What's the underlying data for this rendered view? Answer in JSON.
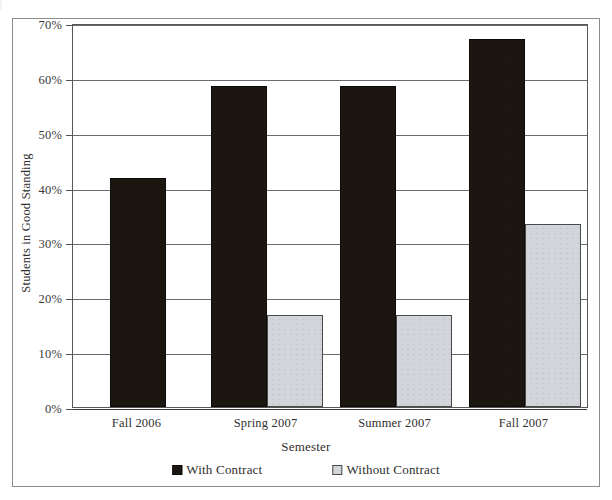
{
  "chart_data": {
    "type": "bar",
    "title": "",
    "xlabel": "Semester",
    "ylabel": "Students in Good Standing",
    "categories": [
      "Fall 2006",
      "Spring 2007",
      "Summer 2007",
      "Fall 2007"
    ],
    "series": [
      {
        "name": "With Contract",
        "values": [
          41.7,
          58.5,
          58.5,
          67.0
        ],
        "color": "#1b1610"
      },
      {
        "name": "Without Contract",
        "values": [
          null,
          16.8,
          16.8,
          33.4
        ],
        "color": "#d2d6da"
      }
    ],
    "ylim": [
      0,
      70
    ],
    "yticks": [
      "0%",
      "10%",
      "20%",
      "30%",
      "40%",
      "50%",
      "60%",
      "70%"
    ],
    "ytick_values": [
      0,
      10,
      20,
      30,
      40,
      50,
      60,
      70
    ],
    "grid": true,
    "legend_position": "bottom"
  },
  "legend": {
    "items": [
      {
        "label": "With Contract",
        "swatch": "dark"
      },
      {
        "label": "Without Contract",
        "swatch": "light"
      }
    ]
  }
}
